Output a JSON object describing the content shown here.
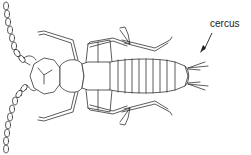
{
  "figure": {
    "labels": [
      {
        "id": "cercus",
        "text": "cercus",
        "points_to": "cercus (tail appendage)"
      }
    ],
    "colors": {
      "line": "#333333",
      "background": "#ffffff"
    }
  }
}
